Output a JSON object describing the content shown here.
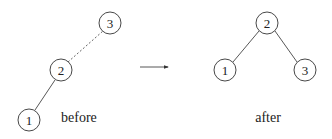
{
  "diagram": {
    "type": "tree-rotation",
    "before": {
      "caption": "before",
      "nodes": [
        {
          "id": "3",
          "label": "3",
          "cx": 110,
          "cy": 23
        },
        {
          "id": "2",
          "label": "2",
          "cx": 61,
          "cy": 70
        },
        {
          "id": "1",
          "label": "1",
          "cx": 29,
          "cy": 120
        }
      ],
      "edges": [
        {
          "from": "2",
          "to": "3",
          "style": "dashed"
        },
        {
          "from": "2",
          "to": "1",
          "style": "solid"
        }
      ]
    },
    "arrow": {
      "x1": 140,
      "y1": 67,
      "x2": 169,
      "y2": 67,
      "direction": "right"
    },
    "after": {
      "caption": "after",
      "nodes": [
        {
          "id": "2",
          "label": "2",
          "cx": 267,
          "cy": 23
        },
        {
          "id": "1",
          "label": "1",
          "cx": 225,
          "cy": 70
        },
        {
          "id": "3",
          "label": "3",
          "cx": 305,
          "cy": 70
        }
      ],
      "edges": [
        {
          "from": "2",
          "to": "1",
          "style": "solid"
        },
        {
          "from": "2",
          "to": "3",
          "style": "solid"
        }
      ]
    },
    "node_radius": 11,
    "colors": {
      "stroke": "#333333",
      "fill": "#ffffff",
      "text": "#222222"
    }
  }
}
